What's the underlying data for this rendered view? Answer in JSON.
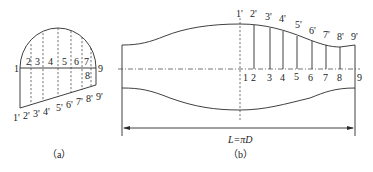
{
  "figure_a": {
    "caption": "（a）",
    "upper_labels": [
      "1",
      "2",
      "3",
      "4",
      "5",
      "6",
      "7",
      "8",
      "9"
    ],
    "lower_labels": [
      "1'",
      "2'",
      "3'",
      "4'",
      "5'",
      "6'",
      "7'",
      "8'",
      "9'"
    ],
    "top_label_row": "2 3  4  5  6  7",
    "left_label": "1",
    "right_label": "9",
    "inner_label": "8",
    "bottom_label_row": "1'2'3'4' 5'6'7'8'9'"
  },
  "figure_b": {
    "caption": "（b）",
    "dimension_label": "L=πD",
    "top_labels": [
      "1'",
      "2'",
      "3'",
      "4'",
      "5'",
      "6'",
      "7'",
      "8'",
      "9'"
    ],
    "axis_labels": [
      "1",
      "2",
      "3",
      "4",
      "5",
      "6",
      "7",
      "8",
      "9"
    ]
  },
  "colors": {
    "line": "#2a2a2a",
    "background": "#ffffff"
  }
}
